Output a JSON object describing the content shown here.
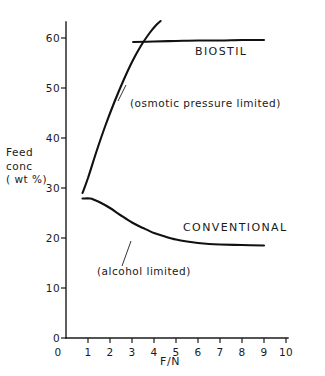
{
  "chart_data": {
    "type": "line",
    "title": "",
    "xlabel": "F/N",
    "ylabel": "Feed conc (wt %)",
    "ylabel_lines": [
      "Feed",
      "conc",
      "( wt %)"
    ],
    "xlim": [
      0,
      10
    ],
    "ylim": [
      0,
      60
    ],
    "xticks": [
      "0",
      "1",
      "2",
      "3",
      "4",
      "5",
      "6",
      "7",
      "8",
      "9",
      "10"
    ],
    "xtick_values": [
      0,
      1,
      2,
      3,
      4,
      5,
      6,
      7,
      8,
      9,
      10
    ],
    "yticks": [
      "0",
      "10",
      "20",
      "30",
      "40",
      "50",
      "60"
    ],
    "ytick_values": [
      0,
      10,
      20,
      30,
      40,
      50,
      60
    ],
    "grid": false,
    "legend_position": "inline-curve-labels",
    "line_color": "#111111",
    "series": [
      {
        "name": "BIOSTIL",
        "annotation": "(osmotic pressure limited)",
        "description": "rising osmotic-pressure-limited branch",
        "x": [
          0.75,
          1.0,
          1.4,
          1.8,
          2.2,
          2.6,
          3.0,
          3.4,
          3.8,
          4.1,
          4.3
        ],
        "values": [
          29.0,
          32.0,
          37.5,
          42.6,
          47.2,
          51.4,
          55.2,
          58.4,
          61.0,
          62.6,
          63.4
        ]
      },
      {
        "name": "BIOSTIL plateau",
        "description": "horizontal osmotic limit plateau",
        "x": [
          3.05,
          4.0,
          5.0,
          6.0,
          7.0,
          8.0,
          9.0
        ],
        "values": [
          59.2,
          59.3,
          59.4,
          59.5,
          59.5,
          59.6,
          59.6
        ]
      },
      {
        "name": "CONVENTIONAL",
        "annotation": "(alcohol limited)",
        "description": "alcohol-limited decaying branch",
        "x": [
          0.75,
          1.1,
          1.3,
          1.6,
          2.0,
          2.5,
          3.0,
          3.5,
          4.0,
          4.5,
          5.0,
          5.5,
          6.0,
          6.5,
          7.0,
          8.0,
          9.0
        ],
        "values": [
          27.9,
          27.9,
          27.6,
          27.0,
          26.0,
          24.5,
          23.1,
          22.0,
          21.0,
          20.3,
          19.7,
          19.3,
          19.0,
          18.8,
          18.7,
          18.6,
          18.5
        ]
      }
    ],
    "curve_labels": [
      {
        "text": "BIOSTIL",
        "x": 6.0,
        "y": 55.5
      },
      {
        "text": "CONVENTIONAL",
        "x": 6.7,
        "y": 21.5
      }
    ],
    "annotations": [
      {
        "text": "(osmotic pressure limited)",
        "x": 3.1,
        "y": 45.5
      },
      {
        "text": "(alcohol limited)",
        "x": 1.6,
        "y": 13.8
      }
    ]
  },
  "axes": {
    "x_title": "F/N",
    "y_title_lines": [
      "Feed",
      "conc",
      "( wt %)"
    ],
    "x_tick_labels": [
      "0",
      "1",
      "2",
      "3",
      "4",
      "5",
      "6",
      "7",
      "8",
      "9",
      "10"
    ],
    "y_tick_labels": [
      "0",
      "10",
      "20",
      "30",
      "40",
      "50",
      "60"
    ]
  },
  "labels": {
    "biostil": "BIOSTIL",
    "conventional": "CONVENTIONAL",
    "osmotic_note": "(osmotic pressure limited)",
    "alcohol_note": "(alcohol limited)"
  }
}
